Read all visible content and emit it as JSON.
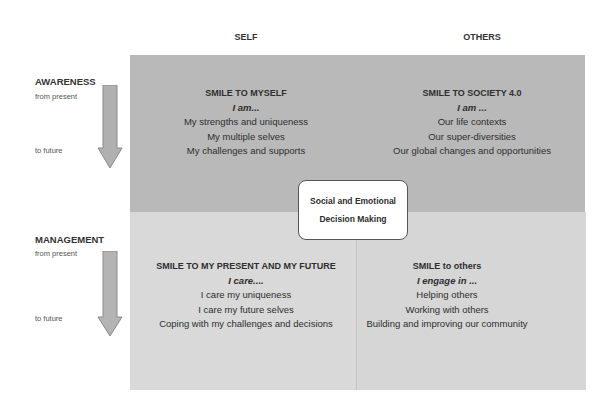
{
  "columns": {
    "self": "SELF",
    "others": "OTHERS"
  },
  "rows": [
    {
      "label": "AWARENESS",
      "from": "from present",
      "to": "to future"
    },
    {
      "label": "MANAGEMENT",
      "from": "from present",
      "to": "to future"
    }
  ],
  "quadrants": {
    "top_left": {
      "title": "SMILE TO  MYSELF",
      "prompt": "I am...",
      "items": [
        "My strengths and uniqueness",
        "My multiple selves",
        "My challenges and supports"
      ]
    },
    "top_right": {
      "title": "SMILE TO SOCIETY 4.0",
      "prompt": "I am  ...",
      "items": [
        "Our life contexts",
        "Our super-diversities",
        "Our global changes and opportunities"
      ]
    },
    "bottom_left": {
      "title": "SMILE TO  MY PRESENT AND MY  FUTURE",
      "prompt": "I  care....",
      "items": [
        "I care  my uniqueness",
        "I care my future selves",
        "Coping with  my challenges and decisions"
      ]
    },
    "bottom_right": {
      "title": "SMILE to others",
      "prompt": "I  engage in ...",
      "items": [
        "Helping others",
        "Working with others",
        "Building and improving our  community"
      ]
    }
  },
  "center": {
    "line1": "Social and Emotional",
    "line2": "Decision Making"
  },
  "colors": {
    "top_fill": "#b9b9b9",
    "bottom_fill": "#d8d8d8",
    "arrow_fill": "#b0b0b0",
    "arrow_stroke": "#8a8a8a"
  }
}
